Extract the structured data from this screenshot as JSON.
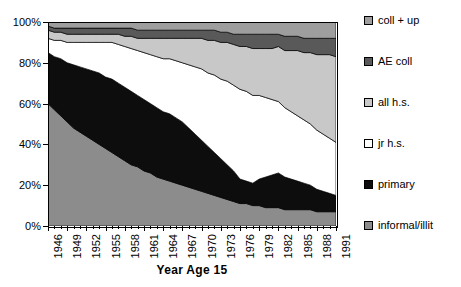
{
  "chart_data": {
    "type": "area",
    "stacked": "percent",
    "title": "",
    "xlabel": "Year Age 15",
    "ylabel": "",
    "ylim": [
      0,
      100
    ],
    "ytick_labels": [
      "0%",
      "20%",
      "40%",
      "60%",
      "80%",
      "100%"
    ],
    "ytick_values": [
      0,
      20,
      40,
      60,
      80,
      100
    ],
    "grid": false,
    "legend_position": "right",
    "xlim": [
      1946,
      1991
    ],
    "x": [
      1946,
      1947,
      1948,
      1949,
      1950,
      1951,
      1952,
      1953,
      1954,
      1955,
      1956,
      1957,
      1958,
      1959,
      1960,
      1961,
      1962,
      1963,
      1964,
      1965,
      1966,
      1967,
      1968,
      1969,
      1970,
      1971,
      1972,
      1973,
      1974,
      1975,
      1976,
      1977,
      1978,
      1979,
      1980,
      1981,
      1982,
      1983,
      1984,
      1985,
      1986,
      1987,
      1988,
      1989,
      1990,
      1991
    ],
    "xtick_labels": [
      "1946",
      "1949",
      "1952",
      "1955",
      "1958",
      "1961",
      "1964",
      "1967",
      "1970",
      "1973",
      "1976",
      "1979",
      "1982",
      "1985",
      "1988",
      "1991"
    ],
    "xtick_label_rotation": 90,
    "minor_ticks_every": 1,
    "series": [
      {
        "name": "informal/illit",
        "color": "#8c8c8c",
        "stack_order": 1,
        "values": [
          60,
          57,
          54,
          51,
          48,
          46,
          44,
          42,
          40,
          38,
          36,
          34,
          32,
          30,
          29,
          27,
          26,
          24,
          23,
          22,
          21,
          20,
          19,
          18,
          17,
          16,
          15,
          14,
          13,
          12,
          11,
          11,
          10,
          10,
          9,
          9,
          9,
          8,
          8,
          8,
          8,
          8,
          7,
          7,
          7,
          7
        ]
      },
      {
        "name": "primary",
        "color": "#0d0d0d",
        "stack_order": 2,
        "values": [
          25,
          26,
          28,
          29,
          31,
          32,
          33,
          34,
          35,
          35,
          36,
          36,
          36,
          36,
          35,
          35,
          34,
          34,
          33,
          33,
          32,
          31,
          29,
          27,
          25,
          23,
          21,
          19,
          17,
          15,
          12,
          11,
          11,
          13,
          15,
          16,
          17,
          16,
          15,
          14,
          13,
          12,
          11,
          10,
          9,
          8
        ]
      },
      {
        "name": "jr h.s.",
        "color": "#ffffff",
        "stack_order": 3,
        "values": [
          7,
          8,
          9,
          10,
          11,
          12,
          13,
          14,
          15,
          17,
          18,
          19,
          20,
          21,
          22,
          23,
          24,
          25,
          26,
          27,
          28,
          29,
          31,
          33,
          35,
          36,
          38,
          39,
          41,
          42,
          44,
          44,
          43,
          41,
          39,
          37,
          35,
          34,
          33,
          32,
          31,
          30,
          29,
          28,
          27,
          26
        ]
      },
      {
        "name": "all h.s.",
        "color": "#c8c8c8",
        "stack_order": 4,
        "values": [
          4,
          4,
          4,
          4,
          4,
          4,
          4,
          4,
          4,
          4,
          4,
          5,
          5,
          6,
          6,
          7,
          8,
          9,
          10,
          10,
          11,
          12,
          13,
          14,
          15,
          16,
          17,
          18,
          19,
          20,
          21,
          22,
          23,
          23,
          24,
          25,
          27,
          28,
          30,
          32,
          33,
          35,
          37,
          39,
          41,
          42
        ]
      },
      {
        "name": "AE coll",
        "color": "#595959",
        "stack_order": 5,
        "values": [
          2,
          2,
          2,
          3,
          3,
          3,
          3,
          3,
          3,
          3,
          3,
          3,
          4,
          4,
          4,
          4,
          4,
          4,
          4,
          4,
          4,
          4,
          4,
          4,
          4,
          5,
          5,
          5,
          5,
          5,
          6,
          6,
          7,
          7,
          7,
          7,
          6,
          7,
          7,
          7,
          7,
          7,
          8,
          8,
          8,
          9
        ]
      },
      {
        "name": "coll + up",
        "color": "#9e9e9e",
        "stack_order": 6,
        "values": [
          2,
          3,
          3,
          3,
          3,
          3,
          3,
          3,
          3,
          3,
          3,
          3,
          3,
          3,
          4,
          4,
          4,
          4,
          4,
          4,
          4,
          4,
          4,
          4,
          4,
          4,
          4,
          5,
          5,
          6,
          6,
          6,
          6,
          6,
          6,
          6,
          6,
          7,
          7,
          7,
          8,
          8,
          8,
          8,
          8,
          8
        ]
      }
    ]
  },
  "legend": {
    "entries": [
      {
        "label": "coll + up",
        "color": "#9e9e9e"
      },
      {
        "label": "AE coll",
        "color": "#595959"
      },
      {
        "label": "all h.s.",
        "color": "#c8c8c8"
      },
      {
        "label": "jr h.s.",
        "color": "#ffffff"
      },
      {
        "label": "primary",
        "color": "#0d0d0d"
      },
      {
        "label": "informal/illit",
        "color": "#8c8c8c"
      }
    ]
  },
  "axis": {
    "x_title": "Year Age 15"
  }
}
